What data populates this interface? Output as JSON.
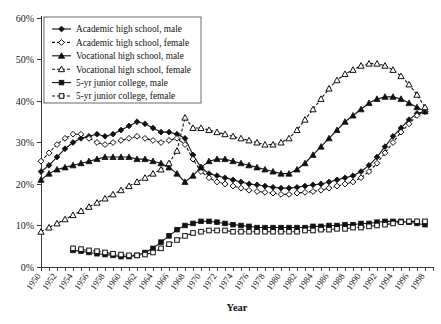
{
  "chart_data": {
    "type": "line",
    "title": "",
    "xlabel": "Year",
    "ylabel": "",
    "xlim": [
      1950,
      1999
    ],
    "ylim": [
      0,
      60
    ],
    "grid": false,
    "legend_position": "top-left",
    "ytick_labels": [
      "0%",
      "10%",
      "20%",
      "30%",
      "40%",
      "50%",
      "60%"
    ],
    "ytick_values": [
      0,
      10,
      20,
      30,
      40,
      50,
      60
    ],
    "xtick_labels": [
      "1950",
      "1952",
      "1954",
      "1956",
      "1958",
      "1960",
      "1962",
      "1964",
      "1966",
      "1968",
      "1970",
      "1972",
      "1974",
      "1976",
      "1978",
      "1980",
      "1982",
      "1984",
      "1986",
      "1988",
      "1990",
      "1992",
      "1994",
      "1996",
      "1998"
    ],
    "xtick_values": [
      1950,
      1952,
      1954,
      1956,
      1958,
      1960,
      1962,
      1964,
      1966,
      1968,
      1970,
      1972,
      1974,
      1976,
      1978,
      1980,
      1982,
      1984,
      1986,
      1988,
      1990,
      1992,
      1994,
      1996,
      1998
    ],
    "x": [
      1950,
      1951,
      1952,
      1953,
      1954,
      1955,
      1956,
      1957,
      1958,
      1959,
      1960,
      1961,
      1962,
      1963,
      1964,
      1965,
      1966,
      1967,
      1968,
      1969,
      1970,
      1971,
      1972,
      1973,
      1974,
      1975,
      1976,
      1977,
      1978,
      1979,
      1980,
      1981,
      1982,
      1983,
      1984,
      1985,
      1986,
      1987,
      1988,
      1989,
      1990,
      1991,
      1992,
      1993,
      1994,
      1995,
      1996,
      1997,
      1998
    ],
    "series": [
      {
        "name": "Academic high school, male",
        "marker": "filled-diamond",
        "line_style": "solid",
        "color": "#111111",
        "values": [
          23.0,
          24.5,
          26.5,
          28.5,
          30.0,
          31.0,
          31.5,
          32.0,
          31.5,
          32.0,
          33.0,
          34.0,
          35.0,
          34.5,
          33.5,
          32.5,
          32.5,
          32.0,
          31.0,
          27.0,
          24.0,
          22.5,
          22.0,
          21.5,
          21.0,
          20.5,
          20.0,
          19.8,
          19.5,
          19.2,
          19.0,
          19.0,
          19.2,
          19.5,
          19.8,
          20.0,
          20.5,
          21.0,
          21.5,
          22.0,
          23.0,
          24.5,
          26.5,
          29.0,
          31.5,
          33.5,
          35.5,
          37.0,
          37.5
        ]
      },
      {
        "name": "Academic high school, female",
        "marker": "open-diamond",
        "line_style": "dashed",
        "color": "#111111",
        "values": [
          25.5,
          27.5,
          29.5,
          31.0,
          32.0,
          32.0,
          31.0,
          30.0,
          29.5,
          30.0,
          30.5,
          31.0,
          31.5,
          31.0,
          30.5,
          30.0,
          30.5,
          31.0,
          29.5,
          26.0,
          23.0,
          21.5,
          20.5,
          20.0,
          19.5,
          19.0,
          18.5,
          18.2,
          18.0,
          17.8,
          17.5,
          17.5,
          17.8,
          18.0,
          18.2,
          18.5,
          19.0,
          19.5,
          20.0,
          20.5,
          21.5,
          23.0,
          25.0,
          27.5,
          30.0,
          32.5,
          34.5,
          36.5,
          37.5
        ]
      },
      {
        "name": "Vocational high school, male",
        "marker": "filled-triangle",
        "line_style": "solid",
        "color": "#111111",
        "values": [
          21.0,
          22.5,
          23.5,
          24.0,
          24.5,
          25.0,
          25.5,
          26.0,
          26.5,
          26.5,
          26.5,
          26.5,
          26.0,
          26.0,
          25.5,
          25.0,
          24.0,
          22.5,
          20.5,
          22.0,
          24.0,
          25.5,
          26.0,
          26.0,
          25.5,
          25.0,
          24.5,
          24.0,
          23.5,
          23.0,
          22.5,
          22.5,
          23.5,
          25.0,
          27.0,
          29.0,
          31.0,
          33.0,
          35.0,
          36.5,
          38.0,
          39.5,
          40.5,
          41.0,
          41.0,
          40.5,
          39.5,
          38.5,
          37.5
        ]
      },
      {
        "name": "Vocational high school, female",
        "marker": "open-triangle",
        "line_style": "dashed",
        "color": "#111111",
        "values": [
          8.5,
          9.5,
          10.5,
          11.5,
          12.5,
          13.5,
          14.5,
          15.5,
          16.5,
          17.5,
          18.5,
          19.5,
          20.5,
          21.5,
          22.5,
          23.5,
          25.0,
          28.0,
          36.0,
          33.5,
          33.5,
          33.0,
          32.5,
          32.0,
          31.5,
          31.0,
          30.5,
          30.0,
          29.5,
          29.5,
          30.0,
          31.0,
          33.0,
          35.5,
          38.0,
          40.5,
          43.0,
          45.0,
          46.5,
          47.5,
          48.5,
          49.0,
          49.0,
          48.5,
          47.5,
          46.0,
          44.0,
          41.5,
          38.5
        ]
      },
      {
        "name": "5-yr junior college, male",
        "marker": "filled-square",
        "line_style": "solid",
        "color": "#111111",
        "values": [
          null,
          null,
          null,
          null,
          4.0,
          3.8,
          3.5,
          3.2,
          3.0,
          2.8,
          2.5,
          2.5,
          2.8,
          3.5,
          4.5,
          6.0,
          7.5,
          9.0,
          10.0,
          10.5,
          11.0,
          11.0,
          10.8,
          10.5,
          10.2,
          10.0,
          9.8,
          9.5,
          9.5,
          9.5,
          9.5,
          9.5,
          9.5,
          9.5,
          9.8,
          9.8,
          10.0,
          10.0,
          10.2,
          10.2,
          10.5,
          10.5,
          10.8,
          11.0,
          11.0,
          11.0,
          10.8,
          10.5,
          10.2
        ]
      },
      {
        "name": "5-yr junior college, female",
        "marker": "open-square",
        "line_style": "dashed",
        "color": "#111111",
        "values": [
          null,
          null,
          null,
          null,
          4.5,
          4.3,
          4.0,
          3.8,
          3.5,
          3.2,
          3.0,
          2.8,
          2.8,
          3.0,
          3.5,
          4.5,
          5.5,
          6.5,
          7.5,
          8.2,
          8.5,
          8.8,
          8.8,
          8.8,
          8.5,
          8.5,
          8.5,
          8.5,
          8.5,
          8.5,
          8.5,
          8.5,
          8.5,
          8.8,
          8.8,
          9.0,
          9.0,
          9.2,
          9.2,
          9.5,
          9.5,
          9.8,
          10.0,
          10.2,
          10.5,
          10.8,
          11.0,
          11.0,
          11.0
        ]
      }
    ]
  },
  "legend": {
    "entries": [
      "Academic high school, male",
      "Academic high school, female",
      "Vocational high school, male",
      "Vocational high school, female",
      "5-yr junior college, male",
      "5-yr junior college, female"
    ]
  },
  "axis": {
    "x_title": "Year"
  }
}
